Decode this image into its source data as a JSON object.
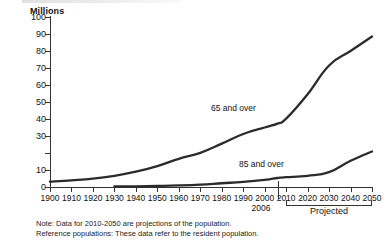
{
  "chart_data": {
    "type": "line",
    "title": "Millions",
    "xlabel": "",
    "ylabel": "Millions",
    "ylim": [
      0,
      100
    ],
    "xlim": [
      1900,
      2050
    ],
    "ytick_step": 10,
    "grid": false,
    "legend": "inline-annotations",
    "yticks": [
      {
        "value": 100,
        "label": "100"
      },
      {
        "value": 90,
        "label": "90"
      },
      {
        "value": 80,
        "label": "80"
      },
      {
        "value": 70,
        "label": "70"
      },
      {
        "value": 60,
        "label": "60"
      },
      {
        "value": 50,
        "label": "50"
      },
      {
        "value": 40,
        "label": "40"
      },
      {
        "value": 30,
        "label": "30"
      },
      {
        "value": 20,
        "label": ""
      },
      {
        "value": 10,
        "label": "10"
      },
      {
        "value": 0,
        "label": "0"
      }
    ],
    "categories": [
      1900,
      1910,
      1920,
      1930,
      1940,
      1950,
      1960,
      1970,
      1980,
      1990,
      2000,
      2010,
      2020,
      2030,
      2040,
      2050
    ],
    "xtick_labels": [
      "1900",
      "1910",
      "1920",
      "1930",
      "1940",
      "1950",
      "1960",
      "1970",
      "1980",
      "1990",
      "2000",
      "2010",
      "2020",
      "2030",
      "2040",
      "2050"
    ],
    "series": [
      {
        "name": "65 and over",
        "label": "65 and over",
        "color": "#2b2b2b",
        "x": [
          1900,
          1910,
          1920,
          1930,
          1940,
          1950,
          1960,
          1970,
          1980,
          1990,
          2000,
          2006,
          2010,
          2020,
          2030,
          2040,
          2050
        ],
        "values": [
          3.1,
          3.9,
          4.9,
          6.6,
          9.0,
          12.3,
          16.6,
          20.1,
          25.5,
          31.2,
          35.0,
          37.3,
          40.2,
          54.6,
          71.5,
          80.0,
          88.5
        ]
      },
      {
        "name": "85 and over",
        "label": "85 and over",
        "color": "#2b2b2b",
        "x": [
          1930,
          1940,
          1950,
          1960,
          1970,
          1980,
          1990,
          2000,
          2006,
          2010,
          2020,
          2030,
          2040,
          2050
        ],
        "values": [
          0.3,
          0.4,
          0.6,
          0.9,
          1.4,
          2.2,
          3.0,
          4.2,
          5.3,
          5.8,
          6.6,
          8.7,
          15.4,
          20.9
        ]
      }
    ],
    "annotations": [
      {
        "name": "year-2006-marker",
        "text": "2006",
        "x": 2006
      },
      {
        "name": "projected-bracket",
        "text": "Projected",
        "x_start": 2010,
        "x_end": 2050
      }
    ]
  },
  "notes": {
    "line1": "Note: Data for 2010-2050 are projections of the population.",
    "line2": "Reference populations: These data refer to the resident population."
  }
}
